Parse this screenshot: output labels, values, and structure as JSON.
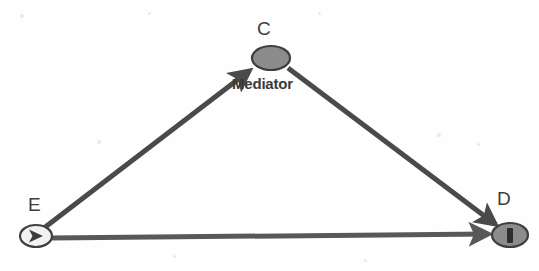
{
  "figure": {
    "type": "path-diagram",
    "background_color": "#fefefe",
    "line_color": "#4a4a4a"
  },
  "nodes": [
    {
      "id": "E",
      "label": "E",
      "role": "exposure",
      "shape": "ellipse",
      "fill_color": "#f2f2f2",
      "stroke_color": "#3f3f3f",
      "glyph": "triangle-right-icon",
      "glyph_color": "#3a3a3a",
      "cx": 36,
      "cy": 236,
      "rx": 16,
      "ry": 11,
      "label_x": 28,
      "label_y": 195
    },
    {
      "id": "C",
      "label": "C",
      "role": "mediator",
      "shape": "ellipse",
      "fill_color": "#8c8c8c",
      "stroke_color": "#3f3f3f",
      "glyph": "none",
      "glyph_color": "#3a3a3a",
      "cx": 271,
      "cy": 58,
      "rx": 19,
      "ry": 12,
      "label_x": 257,
      "label_y": 19
    },
    {
      "id": "D",
      "label": "D",
      "role": "outcome",
      "shape": "ellipse",
      "fill_color": "#8c8c8c",
      "stroke_color": "#3f3f3f",
      "glyph": "bar-vertical-icon",
      "glyph_color": "#2e2e2e",
      "cx": 510,
      "cy": 235,
      "rx": 18,
      "ry": 12,
      "label_x": 497,
      "label_y": 189
    }
  ],
  "edges": [
    {
      "id": "e-to-c",
      "from": "E",
      "to": "C",
      "label": "Mediator",
      "label_x": 232,
      "label_y": 76,
      "x1": 44,
      "y1": 228,
      "x2": 249,
      "y2": 71,
      "color": "#4a4a4a",
      "width": 5,
      "arrowhead": true
    },
    {
      "id": "c-to-d",
      "from": "C",
      "to": "D",
      "label": "",
      "x1": 288,
      "y1": 68,
      "x2": 495,
      "y2": 224,
      "color": "#4a4a4a",
      "width": 5,
      "arrowhead": true
    },
    {
      "id": "e-to-d",
      "from": "E",
      "to": "D",
      "label": "",
      "x1": 50,
      "y1": 238,
      "x2": 490,
      "y2": 234,
      "color": "#585858",
      "width": 5,
      "arrowhead": true
    }
  ],
  "specks": [
    {
      "x": 20,
      "y": 14,
      "w": 4,
      "h": 4
    },
    {
      "x": 148,
      "y": 12,
      "w": 3,
      "h": 3
    },
    {
      "x": 97,
      "y": 140,
      "w": 4,
      "h": 4
    },
    {
      "x": 318,
      "y": 12,
      "w": 3,
      "h": 3
    },
    {
      "x": 437,
      "y": 133,
      "w": 4,
      "h": 4
    },
    {
      "x": 477,
      "y": 143,
      "w": 3,
      "h": 3
    },
    {
      "x": 173,
      "y": 255,
      "w": 3,
      "h": 3
    },
    {
      "x": 364,
      "y": 259,
      "w": 3,
      "h": 3
    }
  ]
}
